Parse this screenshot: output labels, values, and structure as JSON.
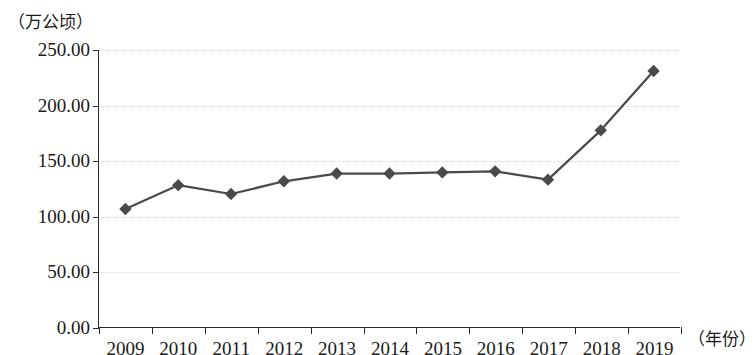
{
  "axes": {
    "y_unit_label": "（万公顷）",
    "x_unit_label": "（年份）"
  },
  "chart_data": {
    "type": "line",
    "title": "",
    "subtitle": "",
    "xlabel": "（年份）",
    "ylabel": "（万公顷）",
    "categories": [
      "2009",
      "2010",
      "2011",
      "2012",
      "2013",
      "2014",
      "2015",
      "2016",
      "2017",
      "2018",
      "2019"
    ],
    "values": [
      106.5,
      128.0,
      120.0,
      131.5,
      138.5,
      138.5,
      139.5,
      140.5,
      133.0,
      177.5,
      231.0
    ],
    "series": [
      {
        "name": "",
        "values": [
          106.5,
          128.0,
          120.0,
          131.5,
          138.5,
          138.5,
          139.5,
          140.5,
          133.0,
          177.5,
          231.0
        ]
      }
    ],
    "ylim": [
      0,
      250
    ],
    "y_ticks": [
      0,
      50,
      100,
      150,
      200,
      250
    ],
    "y_tick_labels": [
      "0.00",
      "50.00",
      "100.00",
      "150.00",
      "200.00",
      "250.00"
    ],
    "grid": true,
    "grid_axis": "y",
    "legend": "none",
    "marker": "diamond",
    "line_color": "#4a4a4a",
    "marker_color": "#4a4a4a",
    "grid_color": "#d8d8dc",
    "axis_color": "#2b2b2b"
  }
}
